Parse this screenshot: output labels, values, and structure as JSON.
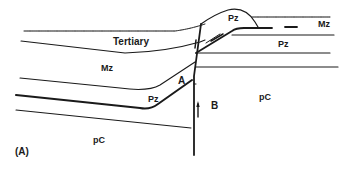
{
  "figure": {
    "panel_label": "(A)",
    "ink_color": "#1a1a1a",
    "background": "#ffffff"
  },
  "units": {
    "tertiary": "Tertiary",
    "mz_left": "Mz",
    "pz_left": "Pz",
    "pc_left": "pC",
    "pz_thrust": "Pz",
    "mz_right": "Mz",
    "pz_right": "Pz",
    "pc_right": "pC"
  },
  "blocks": {
    "a": "A",
    "b": "B"
  }
}
